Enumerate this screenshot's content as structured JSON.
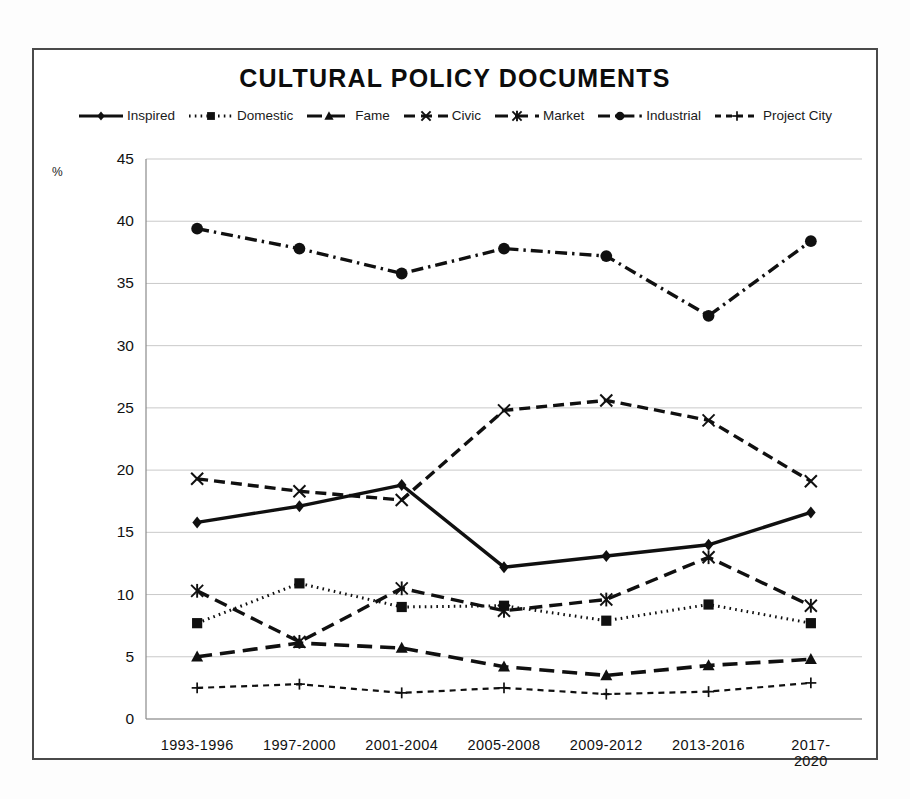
{
  "chart_data": {
    "type": "line",
    "title": "CULTURAL POLICY DOCUMENTS",
    "xlabel": "",
    "ylabel": "%",
    "ylim": [
      0,
      45
    ],
    "ytick_step": 5,
    "yticks": [
      "0",
      "5",
      "10",
      "15",
      "20",
      "25",
      "30",
      "35",
      "40",
      "45"
    ],
    "grid": true,
    "legend_position": "top-center",
    "categories": [
      "1993-1996",
      "1997-2000",
      "2001-2004",
      "2005-2008",
      "2009-2012",
      "2013-2016",
      "2017-2020"
    ],
    "series": [
      {
        "name": "Inspired",
        "marker": "diamond",
        "dash": "solid",
        "values": [
          15.8,
          17.1,
          18.8,
          12.2,
          13.1,
          14.0,
          16.6
        ]
      },
      {
        "name": "Domestic",
        "marker": "square",
        "dash": "dotted",
        "values": [
          7.7,
          10.9,
          9.0,
          9.1,
          7.9,
          9.2,
          7.7
        ]
      },
      {
        "name": "Fame",
        "marker": "triangle",
        "dash": "long-dash",
        "values": [
          5.0,
          6.1,
          5.7,
          4.2,
          3.5,
          4.3,
          4.8
        ]
      },
      {
        "name": "Civic",
        "marker": "cross-x",
        "dash": "dash",
        "values": [
          19.3,
          18.3,
          17.6,
          24.8,
          25.6,
          24.0,
          19.1
        ]
      },
      {
        "name": "Market",
        "marker": "asterisk",
        "dash": "dash-long",
        "values": [
          10.3,
          6.2,
          10.5,
          8.7,
          9.6,
          13.0,
          9.1
        ]
      },
      {
        "name": "Industrial",
        "marker": "circle",
        "dash": "dash-dot",
        "values": [
          39.4,
          37.8,
          35.8,
          37.8,
          37.2,
          32.4,
          38.4
        ]
      },
      {
        "name": "Project City",
        "marker": "plus",
        "dash": "short-dash",
        "values": [
          2.5,
          2.8,
          2.1,
          2.5,
          2.0,
          2.2,
          2.9
        ]
      }
    ]
  },
  "colors": {
    "ink": "#101010",
    "grid": "#c9c9c9",
    "frame": "#4a4a4a",
    "paper": "#ffffff"
  },
  "caption": ""
}
